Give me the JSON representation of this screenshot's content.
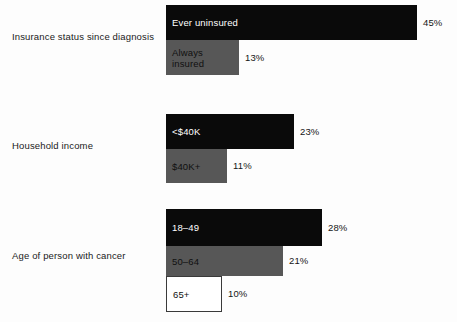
{
  "chart_data": {
    "type": "bar",
    "orientation": "horizontal",
    "title": "",
    "xlabel": "",
    "ylabel": "",
    "grid": false,
    "legend": false,
    "value_suffix": "%",
    "xlim": [
      0,
      45
    ],
    "groups": [
      {
        "label": "Insurance status since diagnosis",
        "bars": [
          {
            "category": "Ever uninsured",
            "value": 45,
            "value_label": "45%",
            "style": "dark"
          },
          {
            "category": "Always\ninsured",
            "value": 13,
            "value_label": "13%",
            "style": "gray"
          }
        ]
      },
      {
        "label": "Household income",
        "bars": [
          {
            "category": "<$40K",
            "value": 23,
            "value_label": "23%",
            "style": "dark"
          },
          {
            "category": "$40K+",
            "value": 11,
            "value_label": "11%",
            "style": "gray"
          }
        ]
      },
      {
        "label": "Age of person with cancer",
        "bars": [
          {
            "category": "18–49",
            "value": 28,
            "value_label": "28%",
            "style": "dark"
          },
          {
            "category": "50–64",
            "value": 21,
            "value_label": "21%",
            "style": "gray"
          },
          {
            "category": "65+",
            "value": 10,
            "value_label": "10%",
            "style": "white"
          }
        ]
      }
    ],
    "colors": {
      "dark": "#0a0a0a",
      "gray": "#575757",
      "white": "#ffffff",
      "white_border": "#3a3a3a",
      "background": "#fdfdfd",
      "text": "#1a1a1a"
    }
  },
  "layout": {
    "bar_origin_x": 166,
    "px_per_percent": 5.58,
    "groups": [
      {
        "top": 5,
        "label_top": 31,
        "bar_heights": [
          35,
          35
        ]
      },
      {
        "top": 114,
        "label_top": 140,
        "bar_heights": [
          35,
          34
        ]
      },
      {
        "top": 209,
        "label_top": 250,
        "bar_heights": [
          37,
          30,
          36
        ]
      }
    ]
  }
}
